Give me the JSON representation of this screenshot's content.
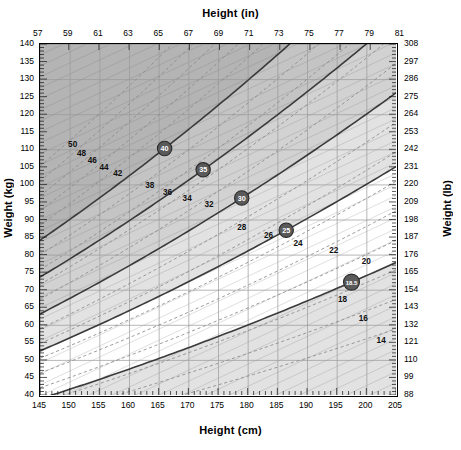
{
  "titles": {
    "top": "Height  (in)",
    "bottom": "Height  (cm)",
    "left": "Weight  (kg)",
    "right": "Weight  (lb)"
  },
  "chart_data": {
    "type": "line",
    "xlabel": "Height  (cm)",
    "ylabel": "Weight  (kg)",
    "xlabel_secondary": "Height  (in)",
    "ylabel_secondary": "Weight  (lb)",
    "xlim": [
      145,
      205
    ],
    "ylim": [
      40,
      140
    ],
    "xlim_secondary": [
      57.09,
      80.71
    ],
    "ylim_secondary": [
      88,
      308
    ],
    "grid": true,
    "legend": "none",
    "x_ticks_cm": [
      145,
      150,
      155,
      160,
      165,
      170,
      175,
      180,
      185,
      190,
      195,
      200,
      205
    ],
    "x_ticks_in": [
      57,
      59,
      61,
      63,
      65,
      67,
      69,
      71,
      73,
      75,
      77,
      79,
      81
    ],
    "y_ticks_kg": [
      140,
      135,
      130,
      125,
      120,
      115,
      110,
      105,
      100,
      95,
      90,
      85,
      80,
      75,
      70,
      65,
      60,
      55,
      50,
      45,
      40
    ],
    "y_ticks_lb": [
      308,
      297,
      286,
      275,
      264,
      253,
      242,
      231,
      220,
      209,
      198,
      187,
      176,
      165,
      154,
      143,
      132,
      121,
      110,
      99,
      88
    ],
    "bmi_curves": [
      {
        "bmi": 50,
        "label": "50",
        "style": "thin",
        "label_at_cm": 150.5
      },
      {
        "bmi": 48,
        "label": "48",
        "style": "thin",
        "label_at_cm": 152.0
      },
      {
        "bmi": 46,
        "label": "46",
        "style": "thin",
        "label_at_cm": 153.8
      },
      {
        "bmi": 44,
        "label": "44",
        "style": "thin",
        "label_at_cm": 155.8
      },
      {
        "bmi": 42,
        "label": "42",
        "style": "thin",
        "label_at_cm": 158.1
      },
      {
        "bmi": 40,
        "label": "40",
        "style": "thick",
        "marker": "circle",
        "label_at_cm": 166.0
      },
      {
        "bmi": 38,
        "label": "38",
        "style": "thin",
        "label_at_cm": 163.5
      },
      {
        "bmi": 36,
        "label": "36",
        "style": "thin",
        "label_at_cm": 166.5
      },
      {
        "bmi": 34,
        "label": "34",
        "style": "thin",
        "label_at_cm": 169.8
      },
      {
        "bmi": 35,
        "label": "35",
        "style": "thick",
        "marker": "circle",
        "label_at_cm": 172.5
      },
      {
        "bmi": 32,
        "label": "32",
        "style": "thin",
        "label_at_cm": 173.5
      },
      {
        "bmi": 30,
        "label": "30",
        "style": "thick",
        "marker": "circle",
        "label_at_cm": 179.0
      },
      {
        "bmi": 28,
        "label": "28",
        "style": "thin",
        "label_at_cm": 179.0
      },
      {
        "bmi": 26,
        "label": "26",
        "style": "thin",
        "label_at_cm": 183.5
      },
      {
        "bmi": 24,
        "label": "24",
        "style": "thin",
        "label_at_cm": 188.5
      },
      {
        "bmi": 25,
        "label": "25",
        "style": "thick",
        "marker": "circle",
        "label_at_cm": 186.5
      },
      {
        "bmi": 22,
        "label": "22",
        "style": "thin",
        "label_at_cm": 194.5
      },
      {
        "bmi": 20,
        "label": "20",
        "style": "thin",
        "label_at_cm": 200.0
      },
      {
        "bmi": 18.5,
        "label": "18.5",
        "style": "thick",
        "marker": "circle",
        "label_at_cm": 197.5
      },
      {
        "bmi": 18,
        "label": "18",
        "style": "thin",
        "label_at_cm": 196.0
      },
      {
        "bmi": 16,
        "label": "16",
        "style": "thin",
        "label_at_cm": 199.5
      },
      {
        "bmi": 14,
        "label": "14",
        "style": "thin",
        "label_at_cm": 202.5
      }
    ],
    "bands": [
      {
        "name": "obese-class-III",
        "bmi_from": 40,
        "bmi_to": 999,
        "color": "#b4b4b4"
      },
      {
        "name": "obese-class-II",
        "bmi_from": 35,
        "bmi_to": 40,
        "color": "#c4c4c4"
      },
      {
        "name": "obese-class-I",
        "bmi_from": 30,
        "bmi_to": 35,
        "color": "#d2d2d2"
      },
      {
        "name": "overweight",
        "bmi_from": 25,
        "bmi_to": 30,
        "color": "#e2e2e2"
      },
      {
        "name": "normal",
        "bmi_from": 18.5,
        "bmi_to": 25,
        "color": "#ffffff"
      },
      {
        "name": "underweight",
        "bmi_from": 0,
        "bmi_to": 18.5,
        "color": "#e2e2e2"
      }
    ],
    "colors": {
      "thick_curve": "#3a3a3a",
      "thin_curve": "#8a8a8a",
      "grid": "#9a9a9a",
      "frame": "#000000",
      "marker_fill": "#5a5a5a",
      "marker_text": "#ffffff"
    }
  }
}
